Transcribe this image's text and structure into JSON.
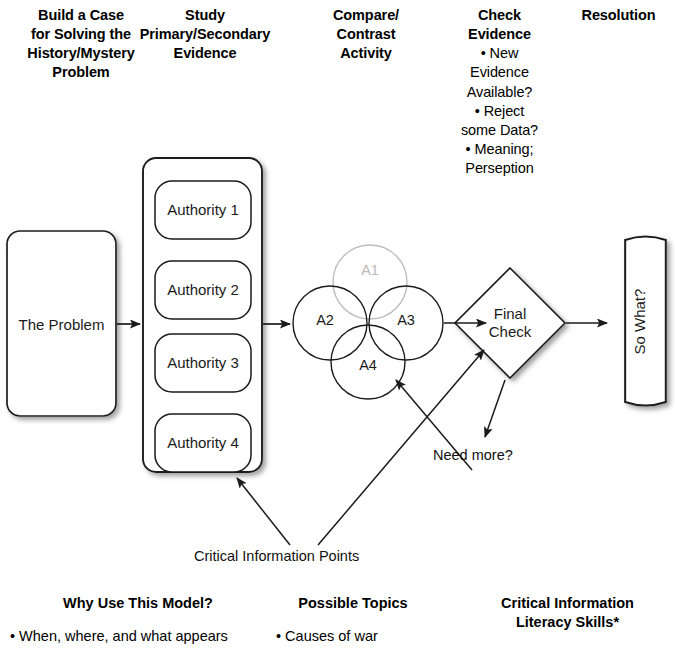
{
  "diagram": {
    "columns": [
      {
        "id": "build-case",
        "title": "Build a Case\nfor Solving the\nHistory/Mystery\nProblem"
      },
      {
        "id": "study-evidence",
        "title": "Study\nPrimary/Secondary\nEvidence"
      },
      {
        "id": "compare-contrast",
        "title": "Compare/\nContrast\nActivity"
      },
      {
        "id": "check-evidence",
        "title": "Check\nEvidence"
      },
      {
        "id": "resolution",
        "title": "Resolution"
      }
    ],
    "column_titles": {
      "build_case_l1": "Build a Case",
      "build_case_l2": "for Solving the",
      "build_case_l3": "History/Mystery",
      "build_case_l4": "Problem",
      "study_l1": "Study",
      "study_l2": "Primary/Secondary",
      "study_l3": "Evidence",
      "compare_l1": "Compare/",
      "compare_l2": "Contrast",
      "compare_l3": "Activity",
      "check_l1": "Check",
      "check_l2": "Evidence",
      "resolution": "Resolution"
    },
    "check_evidence_bullets": [
      "• New",
      "Evidence",
      "Available?",
      "• Reject",
      "some Data?",
      "• Meaning;",
      "Perseption"
    ],
    "nodes": {
      "problem": "The Problem",
      "authorities": [
        "Authority 1",
        "Authority 2",
        "Authority 3",
        "Authority 4"
      ],
      "final_check_l1": "Final",
      "final_check_l2": "Check",
      "so_what": "So What?"
    },
    "venn": {
      "title": "Compare/Contrast Activity",
      "circles": [
        {
          "id": "a1",
          "label": "A1",
          "cx": 370,
          "cy": 282,
          "r": 37,
          "faded": true
        },
        {
          "id": "a2",
          "label": "A2",
          "cx": 330,
          "cy": 323,
          "r": 37,
          "faded": false
        },
        {
          "id": "a3",
          "label": "A3",
          "cx": 406,
          "cy": 323,
          "r": 37,
          "faded": false
        },
        {
          "id": "a4",
          "label": "A4",
          "cx": 368,
          "cy": 362,
          "r": 37,
          "faded": false
        }
      ]
    },
    "annotations": [
      {
        "id": "need-more",
        "text": "Need more?"
      },
      {
        "id": "critical-information-points",
        "text": "Critical Information Points"
      }
    ],
    "annotation_text": {
      "need_more": "Need more?",
      "critical_points": "Critical Information Points"
    }
  },
  "footer": {
    "columns": [
      {
        "id": "why-use-this-model",
        "heading": "Why Use This Model?",
        "heading_l2": "",
        "items": [
          "• When, where, and what appears"
        ]
      },
      {
        "id": "possible-topics",
        "heading": "Possible Topics",
        "heading_l2": "",
        "items": [
          "• Causes of war"
        ]
      },
      {
        "id": "critical-information-literacy-skills",
        "heading": "Critical Information",
        "heading_l2": "Literacy Skills*",
        "items": []
      }
    ]
  },
  "colors": {
    "stroke": "#1b1b1b",
    "faded_stroke": "#bdbdbd",
    "text": "#000000",
    "shadow": "#9a9a9a",
    "background": "#ffffff"
  }
}
